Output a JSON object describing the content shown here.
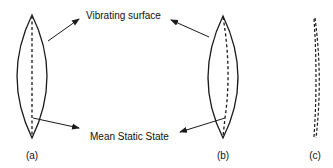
{
  "diagram": {
    "annotations": {
      "vibrating_surface": "Vibrating surface",
      "mean_static_state": "Mean Static State"
    },
    "panels": [
      {
        "id": "a",
        "caption": "(a)",
        "description": "Lens-shaped vibrating surface with straight dashed mean line"
      },
      {
        "id": "b",
        "caption": "(b)",
        "description": "Lens-shaped vibrating surface with curved dashed mean line"
      },
      {
        "id": "c",
        "caption": "(c)",
        "description": "Curved dashed mean static state only"
      }
    ],
    "colors": {
      "stroke": "#1a1a1a",
      "background": "#ffffff"
    }
  }
}
